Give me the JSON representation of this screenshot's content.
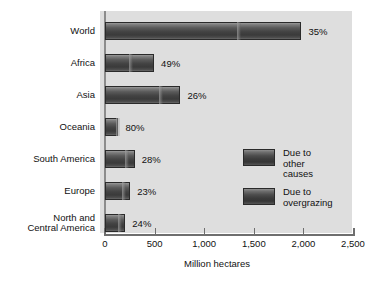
{
  "chart_data": {
    "type": "bar",
    "orientation": "horizontal",
    "title": "",
    "xlabel": "Million hectares",
    "ylabel": "",
    "xlim": [
      0,
      2500
    ],
    "xticks": [
      0,
      500,
      1000,
      1500,
      2000,
      2500
    ],
    "xtick_labels": [
      "0",
      "500",
      "1,000",
      "1,500",
      "2,000",
      "2,500"
    ],
    "grid": false,
    "legend_position": "center-right",
    "categories": [
      "World",
      "Africa",
      "Asia",
      "Oceania",
      "South America",
      "Europe",
      "North and\nCentral America"
    ],
    "series": [
      {
        "name": "Due to overgrazing",
        "values": [
          1330,
          245,
          545,
          110,
          205,
          175,
          135
        ]
      },
      {
        "name": "Due to other causes",
        "values": [
          650,
          250,
          215,
          25,
          95,
          80,
          70
        ]
      }
    ],
    "totals": [
      1980,
      495,
      760,
      135,
      300,
      255,
      205
    ],
    "annotations": [
      "35%",
      "49%",
      "26%",
      "80%",
      "28%",
      "23%",
      "24%"
    ],
    "annotation_note": "Percent due to overgrazing",
    "colors": {
      "bar_dark": "#3c3c3c",
      "bar_light": "#9a9a9a",
      "panel_background": "#dedede",
      "page_background": "#ffffff",
      "axis": "#6e6e6e",
      "text": "#111111"
    }
  },
  "chart": {
    "axis_title": "Million hectares",
    "ticks": [
      {
        "label": "0",
        "value": 0
      },
      {
        "label": "500",
        "value": 500
      },
      {
        "label": "1,000",
        "value": 1000
      },
      {
        "label": "1,500",
        "value": 1500
      },
      {
        "label": "2,000",
        "value": 2000
      },
      {
        "label": "2,500",
        "value": 2500
      }
    ],
    "rows": [
      {
        "label": "World",
        "overgrazing": 1330,
        "other": 650,
        "total": 1980,
        "percent": "35%"
      },
      {
        "label": "Africa",
        "overgrazing": 245,
        "other": 250,
        "total": 495,
        "percent": "49%"
      },
      {
        "label": "Asia",
        "overgrazing": 545,
        "other": 215,
        "total": 760,
        "percent": "26%"
      },
      {
        "label": "Oceania",
        "overgrazing": 110,
        "other": 25,
        "total": 135,
        "percent": "80%"
      },
      {
        "label": "South America",
        "overgrazing": 205,
        "other": 95,
        "total": 300,
        "percent": "28%"
      },
      {
        "label": "Europe",
        "overgrazing": 175,
        "other": 80,
        "total": 255,
        "percent": "23%"
      },
      {
        "label": "North and\nCentral America",
        "overgrazing": 135,
        "other": 70,
        "total": 205,
        "percent": "24%"
      }
    ],
    "legend": [
      {
        "label": "Due to\nother causes"
      },
      {
        "label": "Due to\novergrazing"
      }
    ]
  }
}
